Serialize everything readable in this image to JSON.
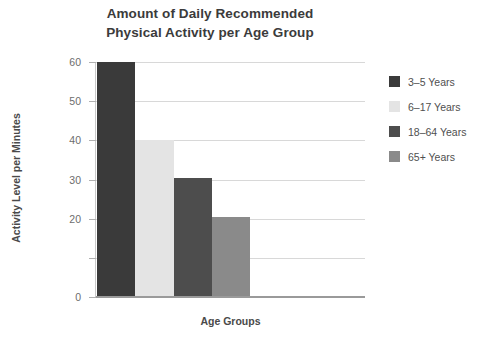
{
  "chart_data": {
    "type": "bar",
    "title": "Amount of Daily Recommended Physical Activity per Age Group",
    "title_lines": [
      "Amount of Daily Recommended",
      "Physical Activity per Age Group"
    ],
    "xlabel": "Age Groups",
    "ylabel": "Activity Level per Minutes",
    "categories": [
      "3–5 Years",
      "6–17 Years",
      "18–64 Years",
      "65+ Years"
    ],
    "values": [
      60,
      40,
      30.5,
      20.5
    ],
    "colors": [
      "#3a3a3a",
      "#e4e4e4",
      "#4d4d4d",
      "#8a8a8a"
    ],
    "ylim": [
      0,
      60
    ],
    "ytick_values": [
      60,
      50,
      40,
      30,
      20,
      10,
      0
    ],
    "ytick_labels": [
      "60",
      "50",
      "40",
      "30",
      "20",
      "",
      "0"
    ],
    "grid": true,
    "grid_axis": "y",
    "legend_position": "right",
    "series": [
      {
        "name": "3–5 Years",
        "value": 60,
        "color": "#3a3a3a"
      },
      {
        "name": "6–17 Years",
        "value": 40,
        "color": "#e4e4e4"
      },
      {
        "name": "18–64 Years",
        "value": 30.5,
        "color": "#4d4d4d"
      },
      {
        "name": "65+ Years",
        "value": 20.5,
        "color": "#8a8a8a"
      }
    ]
  },
  "legend": {
    "items": [
      {
        "label": "3–5 Years",
        "color": "#3a3a3a"
      },
      {
        "label": "6–17 Years",
        "color": "#e4e4e4"
      },
      {
        "label": "18–64 Years",
        "color": "#4d4d4d"
      },
      {
        "label": "65+ Years",
        "color": "#8a8a8a"
      }
    ]
  },
  "style": {
    "background": "#ffffff",
    "gridline_color": "#d8d8d8",
    "axis_color": "#9a9a9a",
    "title_color": "#3b3b3b",
    "tick_label_color": "#6d6d6d",
    "axis_title_color": "#4a4a4a"
  }
}
